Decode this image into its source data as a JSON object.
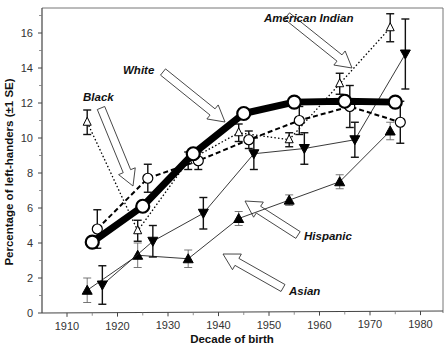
{
  "chart_data": {
    "type": "line",
    "title": "",
    "xlabel": "Decade of birth",
    "ylabel": "Percentage of left-handers (±1 SE)",
    "xlim": [
      1905,
      1985
    ],
    "ylim": [
      0,
      17
    ],
    "xticks": [
      1910,
      1920,
      1930,
      1940,
      1950,
      1960,
      1970,
      1980
    ],
    "yticks": [
      0,
      2,
      4,
      6,
      8,
      10,
      12,
      14,
      16
    ],
    "grid": false,
    "legend": "none (inline annotations with arrows)",
    "series": [
      {
        "name": "White",
        "marker": "open-circle-large",
        "line": "thick-solid",
        "x": [
          1915,
          1925,
          1935,
          1945,
          1955,
          1965,
          1975
        ],
        "y": [
          4.05,
          6.1,
          9.1,
          11.4,
          12.05,
          12.1,
          12.05
        ],
        "se": [
          0.3,
          0.2,
          0.2,
          0.15,
          0.15,
          0.15,
          0.2
        ]
      },
      {
        "name": "Black",
        "marker": "open-circle",
        "line": "dashed",
        "x": [
          1916,
          1926,
          1936,
          1946,
          1956,
          1966,
          1976
        ],
        "y": [
          4.8,
          7.7,
          8.7,
          9.9,
          11.0,
          11.8,
          10.9
        ],
        "se": [
          1.1,
          0.8,
          0.5,
          0.5,
          0.8,
          1.2,
          1.2
        ]
      },
      {
        "name": "American Indian",
        "marker": "open-triangle",
        "line": "dotted",
        "x": [
          1914,
          1924,
          1934,
          1944,
          1954,
          1964,
          1974
        ],
        "y": [
          10.9,
          4.7,
          8.7,
          10.3,
          9.9,
          13.1,
          16.3
        ],
        "se": [
          0.7,
          0.6,
          0.5,
          0.5,
          0.4,
          0.6,
          0.8
        ]
      },
      {
        "name": "Hispanic",
        "marker": "filled-down-triangle",
        "line": "thin-solid",
        "x": [
          1917,
          1927,
          1937,
          1947,
          1957,
          1967,
          1977
        ],
        "y": [
          1.6,
          4.1,
          5.7,
          9.1,
          9.4,
          9.9,
          14.8
        ],
        "se": [
          1.1,
          0.9,
          0.9,
          0.9,
          0.9,
          1.0,
          2.0
        ]
      },
      {
        "name": "Asian",
        "marker": "filled-triangle",
        "line": "thin-solid",
        "x": [
          1914,
          1924,
          1934,
          1944,
          1954,
          1964,
          1974
        ],
        "y": [
          1.3,
          3.3,
          3.1,
          5.4,
          6.45,
          7.5,
          10.4
        ],
        "se": [
          0.7,
          0.7,
          0.5,
          0.4,
          0.3,
          0.4,
          0.5
        ]
      }
    ],
    "annotations": [
      {
        "text": "American Indian",
        "points_to": "American Indian"
      },
      {
        "text": "White",
        "points_to": "White"
      },
      {
        "text": "Black",
        "points_to": "Black"
      },
      {
        "text": "Hispanic",
        "points_to": "Hispanic"
      },
      {
        "text": "Asian",
        "points_to": "Asian"
      }
    ]
  }
}
